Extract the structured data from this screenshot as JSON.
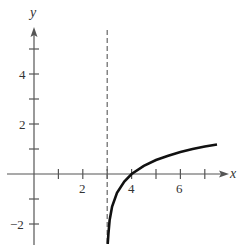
{
  "chart_data": {
    "type": "line",
    "title": "",
    "xlabel": "x",
    "ylabel": "y",
    "xlim": [
      -1.2,
      8.0
    ],
    "ylim": [
      -2.8,
      5.8
    ],
    "x_ticks": [
      1,
      2,
      3,
      4,
      5,
      6,
      7
    ],
    "x_tick_labels": [
      "2",
      "4",
      "6"
    ],
    "y_ticks": [
      -2,
      -1,
      1,
      2,
      3,
      4,
      5
    ],
    "y_tick_labels": [
      "-2",
      "2",
      "4"
    ],
    "asymptote": {
      "type": "vertical",
      "x": 3,
      "style": "dashed"
    },
    "series": [
      {
        "name": "y = ln(x - 3)",
        "x": [
          3.02,
          3.05,
          3.1,
          3.2,
          3.4,
          3.7,
          4.0,
          4.5,
          5.0,
          5.5,
          6.0,
          6.5,
          7.0,
          7.5
        ],
        "y": [
          -2.8,
          -2.4,
          -1.85,
          -1.3,
          -0.75,
          -0.3,
          0.0,
          0.33,
          0.56,
          0.73,
          0.88,
          1.0,
          1.1,
          1.18
        ]
      }
    ],
    "grid": false
  },
  "labels": {
    "x_axis": "x",
    "y_axis": "y",
    "t2": "2",
    "t4": "4",
    "t6": "6",
    "ty4": "4",
    "ty2": "2",
    "tyn2": "−2"
  }
}
